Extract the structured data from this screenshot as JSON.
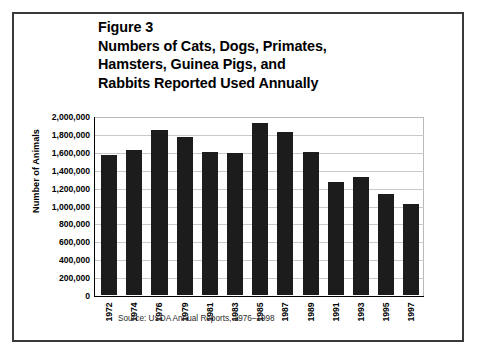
{
  "figure": {
    "title_lines": [
      "Figure 3",
      "Numbers of Cats, Dogs, Primates,",
      "Hamsters, Guinea Pigs, and",
      "Rabbits Reported Used Annually"
    ],
    "source_note": "Source: USDA Annual Reports, 1976–1998",
    "bar_color": "#1c1c1c",
    "gridline_color": "#c9c9c9",
    "border_color": "#3a3a3a"
  },
  "chart_data": {
    "type": "bar",
    "title": "Figure 3 Numbers of Cats, Dogs, Primates, Hamsters, Guinea Pigs, and Rabbits Reported Used Annually",
    "xlabel": "",
    "ylabel": "Number of Animals",
    "categories": [
      "1972",
      "1974",
      "1976",
      "1979",
      "1981",
      "1983",
      "1985",
      "1987",
      "1989",
      "1991",
      "1993",
      "1995",
      "1997"
    ],
    "values": [
      1570000,
      1630000,
      1850000,
      1780000,
      1610000,
      1590000,
      1930000,
      1830000,
      1610000,
      1270000,
      1320000,
      1130000,
      1020000
    ],
    "ylim": [
      0,
      2000000
    ],
    "ytick_values": [
      2000000,
      1800000,
      1600000,
      1400000,
      1200000,
      1000000,
      800000,
      600000,
      400000,
      200000,
      0
    ],
    "ytick_labels": [
      "2,000,000",
      "1,800,000",
      "1,600,000",
      "1,400,000",
      "1,200,000",
      "1,000,000",
      "800,000",
      "600,000",
      "400,000",
      "200,000",
      "0"
    ],
    "grid": true,
    "legend": false,
    "legend_position": "none"
  }
}
